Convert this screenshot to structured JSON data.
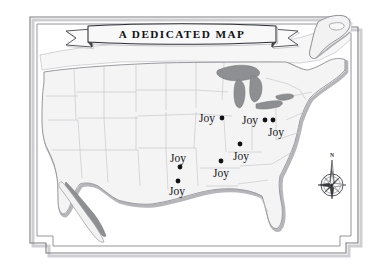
{
  "figure": {
    "kind": "decorative-map",
    "region": "united-states",
    "background_color": "#ffffff"
  },
  "banner": {
    "title": "A Dedicated Map",
    "title_display": "A DEDICATED MAP",
    "fill_color": "#f7f7f7",
    "stroke_color": "#2b2c30",
    "shadow_color": "#b9b9bd"
  },
  "border": {
    "style": "double-line-stepped-corner",
    "outer_color": "#6f7075",
    "inner_color": "#6f7075",
    "shadow_color": "#c9c9cd"
  },
  "map": {
    "land_fill": "#f4f4f4",
    "land_stroke": "#9a9a9f",
    "state_stroke": "#c2c2c6",
    "water_fill": "#8e8f93",
    "coast_shadow": "#adadb1",
    "neighbor_fill": "#f2f2f2"
  },
  "markers": {
    "label_text": "Joy",
    "dot_color": "#111216",
    "dot_radius": 2.4,
    "items": [
      {
        "id": "marker-1",
        "label": "Joy",
        "dot_x": 222,
        "dot_y": 118,
        "label_x": 199,
        "label_y": 122,
        "label_anchor": "start"
      },
      {
        "id": "marker-2",
        "label": "Joy",
        "dot_x": 265,
        "dot_y": 120,
        "label_x": 242,
        "label_y": 124,
        "label_anchor": "start"
      },
      {
        "id": "marker-3",
        "label": "Joy",
        "dot_x": 273,
        "dot_y": 120,
        "label_x": 268,
        "label_y": 136,
        "label_anchor": "start"
      },
      {
        "id": "marker-4",
        "label": "Joy",
        "dot_x": 240,
        "dot_y": 144,
        "label_x": 233,
        "label_y": 160,
        "label_anchor": "start"
      },
      {
        "id": "marker-5",
        "label": "Joy",
        "dot_x": 180,
        "dot_y": 167,
        "label_x": 170,
        "label_y": 162,
        "label_anchor": "start"
      },
      {
        "id": "marker-6",
        "label": "Joy",
        "dot_x": 221,
        "dot_y": 161,
        "label_x": 213,
        "label_y": 177,
        "label_anchor": "start"
      },
      {
        "id": "marker-7",
        "label": "Joy",
        "dot_x": 178,
        "dot_y": 181,
        "label_x": 169,
        "label_y": 195,
        "label_anchor": "start"
      }
    ]
  },
  "compass": {
    "label_north": "N",
    "center_x": 332,
    "center_y": 185,
    "radius": 11,
    "needle_top_y": 153,
    "fill_light": "#f6f6f6",
    "fill_dark": "#3a3b40",
    "stroke": "#2e2f34"
  }
}
